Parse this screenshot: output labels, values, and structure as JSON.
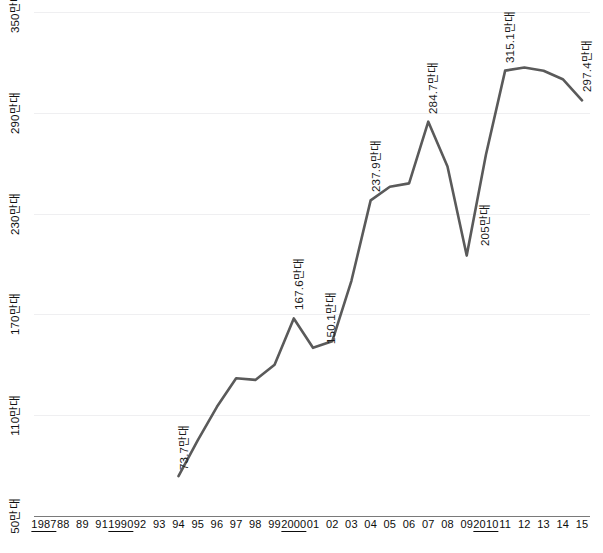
{
  "chart_data": {
    "type": "line",
    "title": "",
    "subtitle": "",
    "xlabel": "",
    "ylabel": "",
    "unit": "만대",
    "grid": true,
    "legend": "none",
    "line_color": "#5a5a5a",
    "gridline_color": "#efeff1",
    "axis_color": "#7a7a7a",
    "ylim": [
      50,
      350
    ],
    "yticks": [
      50,
      110,
      170,
      230,
      290,
      350
    ],
    "ytick_labels": [
      "50만대",
      "110만대",
      "170만대",
      "230만대",
      "290만대",
      "350만대"
    ],
    "xtick_labels": [
      "1987",
      "88",
      "89",
      "91",
      "1990",
      "92",
      "93",
      "94",
      "95",
      "96",
      "97",
      "98",
      "99",
      "2000",
      "01",
      "02",
      "03",
      "04",
      "05",
      "06",
      "07",
      "08",
      "09",
      "2010",
      "11",
      "12",
      "13",
      "14",
      "15"
    ],
    "xtick_underlined": [
      true,
      false,
      false,
      false,
      true,
      false,
      false,
      false,
      false,
      false,
      false,
      false,
      false,
      true,
      false,
      false,
      false,
      false,
      false,
      false,
      false,
      false,
      false,
      true,
      false,
      false,
      false,
      false,
      false
    ],
    "x": [
      "94",
      "95",
      "96",
      "97",
      "98",
      "99",
      "2000",
      "01",
      "02",
      "03",
      "04",
      "05",
      "06",
      "07",
      "08",
      "09",
      "2010",
      "11",
      "12",
      "13",
      "14",
      "15"
    ],
    "values": [
      73.7,
      95.0,
      115.0,
      132.0,
      131.0,
      140.0,
      167.6,
      150.1,
      154.0,
      190.0,
      237.9,
      246.0,
      248.0,
      284.7,
      258.0,
      205.0,
      265.0,
      315.1,
      317.0,
      315.0,
      310.0,
      297.4
    ],
    "point_labels": [
      {
        "x": "94",
        "value": 73.7,
        "label": "73.7만대"
      },
      {
        "x": "2000",
        "value": 167.6,
        "label": "167.6만대"
      },
      {
        "x": "01",
        "value": 150.1,
        "label": "150.1만대"
      },
      {
        "x": "04",
        "value": 237.9,
        "label": "237.9만대"
      },
      {
        "x": "07",
        "value": 284.7,
        "label": "284.7만대"
      },
      {
        "x": "09",
        "value": 205.0,
        "label": "205만대"
      },
      {
        "x": "11",
        "value": 315.1,
        "label": "315.1만대"
      },
      {
        "x": "15",
        "value": 297.4,
        "label": "297.4만대"
      }
    ]
  }
}
